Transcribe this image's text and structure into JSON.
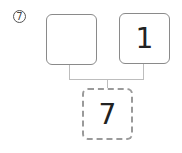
{
  "diagram": {
    "step_label": "⑦",
    "step_number": 7,
    "inputs": [
      {
        "position": "left",
        "value": ""
      },
      {
        "position": "right",
        "value": "1"
      }
    ],
    "result": {
      "value": "7",
      "border_style": "dashed"
    },
    "colors": {
      "box_border": "#8a8a8a",
      "result_border": "#9a9a9a",
      "connector": "#bdbdbd",
      "text": "#222222"
    }
  }
}
